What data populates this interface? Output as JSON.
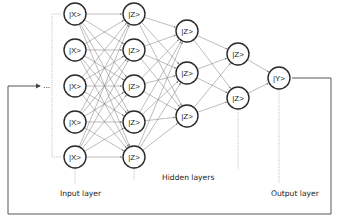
{
  "diagram": {
    "type": "neural-network",
    "layers": [
      {
        "name": "input",
        "label": "Input layer",
        "x": 75,
        "node_label": "|X>",
        "ys": [
          14,
          50,
          86,
          122,
          157
        ]
      },
      {
        "name": "hidden1",
        "label": "",
        "x": 134,
        "node_label": "|Z>",
        "ys": [
          14,
          50,
          86,
          122,
          157
        ]
      },
      {
        "name": "hidden2",
        "label": "",
        "x": 187,
        "node_label": "|Z>",
        "ys": [
          31,
          73,
          116
        ]
      },
      {
        "name": "hidden3",
        "label": "",
        "x": 238,
        "node_label": "|Z>",
        "ys": [
          54,
          98
        ]
      },
      {
        "name": "output",
        "label": "Output layer",
        "x": 279,
        "node_label": "|Y>",
        "ys": [
          78
        ]
      }
    ],
    "labels": {
      "input": "Input layer",
      "hidden": "Hidden layers",
      "output": "Output layer"
    },
    "ellipsis": "...",
    "colors": {
      "node_stroke": "#2a2a2a",
      "edge": "#7a7a7a",
      "dotted": "#aaaaaa",
      "feedback": "#444444"
    }
  }
}
